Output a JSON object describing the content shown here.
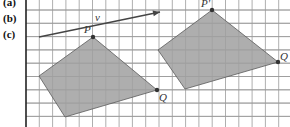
{
  "parts": [
    {
      "label": "(a)",
      "y": -4
    },
    {
      "label": "(b)",
      "y": 12
    },
    {
      "label": "(c)",
      "y": 28
    }
  ],
  "grid": {
    "origin_x": 26,
    "spacing": 13.3,
    "first_h_line_y": 10,
    "line_color": "#9a9a9a",
    "axis_color": "#222222"
  },
  "vector": {
    "label": "v",
    "from": [
      39,
      37
    ],
    "to": [
      160,
      12
    ],
    "label_pos": [
      95,
      21
    ],
    "color": "#444444"
  },
  "shapes": [
    {
      "name": "original",
      "points": [
        [
          93,
          37
        ],
        [
          157,
          90
        ],
        [
          65,
          117
        ],
        [
          39,
          76
        ]
      ],
      "fill": "#a0a0a0",
      "vertices": [
        {
          "label": "P",
          "pos": [
            93,
            37
          ],
          "label_pos": [
            84,
            33
          ]
        },
        {
          "label": "Q",
          "pos": [
            157,
            90
          ],
          "label_pos": [
            159,
            101
          ]
        }
      ]
    },
    {
      "name": "translated",
      "points": [
        [
          212,
          10
        ],
        [
          278,
          62
        ],
        [
          185,
          89
        ],
        [
          158,
          50
        ]
      ],
      "fill": "#a0a0a0",
      "vertices": [
        {
          "label": "P'",
          "pos": [
            212,
            10
          ],
          "label_pos": [
            201,
            7
          ]
        },
        {
          "label": "Q",
          "pos": [
            278,
            62
          ],
          "label_pos": [
            280,
            60
          ]
        }
      ]
    }
  ]
}
